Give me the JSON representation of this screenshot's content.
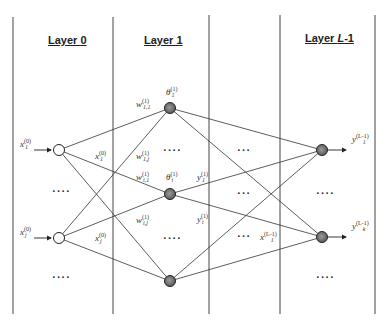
{
  "diagram": {
    "type": "feedforward-neural-network",
    "layers": [
      {
        "label": "Layer 0",
        "italic_part": ""
      },
      {
        "label": "Layer 1",
        "italic_part": ""
      },
      {
        "label": "Layer ",
        "italic_part": "L",
        "suffix": "-1"
      }
    ],
    "inputs": [
      {
        "symbol": "x",
        "sub": "1",
        "sup": "(0)"
      },
      {
        "symbol": "x",
        "sub": "j",
        "sup": "(0)"
      }
    ],
    "edge_inputs": [
      {
        "symbol": "x",
        "sub": "1",
        "sup": "(0)"
      },
      {
        "symbol": "x",
        "sub": "j",
        "sup": "(0)"
      }
    ],
    "weights": [
      {
        "symbol": "w",
        "sub": "1,1",
        "sup": "(1)"
      },
      {
        "symbol": "w",
        "sub": "1,j",
        "sup": "(1)"
      },
      {
        "symbol": "w",
        "sub": "i,1",
        "sup": "(1)"
      },
      {
        "symbol": "w",
        "sub": "i,j",
        "sup": "(1)"
      }
    ],
    "thresholds": [
      {
        "symbol": "θ",
        "sub": "1",
        "sup": "(1)"
      },
      {
        "symbol": "θ",
        "sub": "i",
        "sup": "(1)"
      }
    ],
    "hidden_outputs": [
      {
        "symbol": "y",
        "sub": "1",
        "sup": "(1)"
      },
      {
        "symbol": "y",
        "sub": "i",
        "sup": "(1)"
      }
    ],
    "last_inputs": [
      {
        "symbol": "x",
        "sub": "1",
        "sup": "(L-1)"
      }
    ],
    "outputs": [
      {
        "symbol": "y",
        "sub": "1",
        "sup": "(L-1)"
      },
      {
        "symbol": "y",
        "sub": "k",
        "sup": "(L-1)"
      }
    ],
    "ellipsis_long": "····",
    "ellipsis_short": "···",
    "colors": {
      "line": "#333333",
      "input_node_fill": "#ffffff",
      "neuron_fill": "#777777"
    }
  }
}
